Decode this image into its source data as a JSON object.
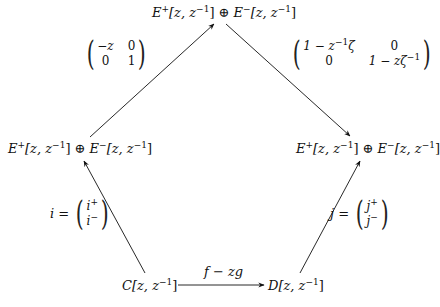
{
  "diagram": {
    "type": "commutative-diagram",
    "nodes": {
      "top": {
        "id": "E_sum_top",
        "text": "E⁺[z, z⁻¹] ⊕ E⁻[z, z⁻¹]",
        "p1": "E",
        "s1": "+",
        "a1": "[z, z",
        "e1": "−1",
        "b1": "] ⊕ ",
        "p2": "E",
        "s2": "−",
        "a2": "[z, z",
        "e2": "−1",
        "b2": "]"
      },
      "left": {
        "id": "E_sum_left",
        "text": "E⁺[z, z⁻¹] ⊕ E⁻[z, z⁻¹]",
        "p1": "E",
        "s1": "+",
        "a1": "[z, z",
        "e1": "−1",
        "b1": "] ⊕ ",
        "p2": "E",
        "s2": "−",
        "a2": "[z, z",
        "e2": "−1",
        "b2": "]"
      },
      "right": {
        "id": "E_sum_right",
        "text": "E⁺[z, z⁻¹] ⊕ E⁻[z, z⁻¹]",
        "p1": "E",
        "s1": "+",
        "a1": "[z, z",
        "e1": "−1",
        "b1": "] ⊕ ",
        "p2": "E",
        "s2": "−",
        "a2": "[z, z",
        "e2": "−1",
        "b2": "]"
      },
      "bottom_left": {
        "id": "C",
        "p": "C",
        "a": "[z, z",
        "e": "−1",
        "b": "]"
      },
      "bottom_right": {
        "id": "D",
        "p": "D",
        "a": "[z, z",
        "e": "−1",
        "b": "]"
      }
    },
    "edges": [
      {
        "from": "E_sum_left",
        "to": "E_sum_top",
        "label": "matrix(-z 0; 0 1)"
      },
      {
        "from": "E_sum_top",
        "to": "E_sum_right",
        "label": "matrix(1 - z^-1 ζ 0; 0 1 - z ζ^-1)"
      },
      {
        "from": "C",
        "to": "E_sum_left",
        "label": "i = (i+; i-)"
      },
      {
        "from": "D",
        "to": "E_sum_right",
        "label": "j = (j+; j-)"
      },
      {
        "from": "C",
        "to": "D",
        "label": "f − zg"
      }
    ],
    "labels": {
      "left_matrix": {
        "r1c1": "−z",
        "r1c2": "0",
        "r2c1": "0",
        "r2c2": "1"
      },
      "right_matrix": {
        "r1c1_a": "1 − z",
        "r1c1_e": "−1",
        "r1c1_b": "ζ",
        "r1c2": "0",
        "r2c1": "0",
        "r2c2_a": "1 − zζ",
        "r2c2_e": "−1"
      },
      "i_map": {
        "name": "i",
        "eq": " = ",
        "top": "i",
        "top_sup": "+",
        "bottom": "i",
        "bottom_sup": "−"
      },
      "j_map": {
        "name": "j",
        "eq": " = ",
        "top": "j",
        "top_sup": "+",
        "bottom": "j",
        "bottom_sup": "−"
      },
      "bottom_arrow": "f − zg"
    },
    "colors": {
      "ink": "#111111",
      "background": "#ffffff"
    }
  }
}
